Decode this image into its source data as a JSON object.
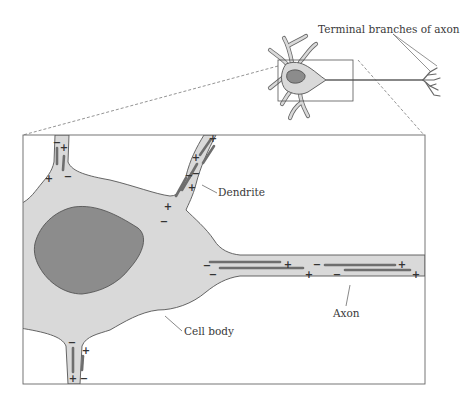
{
  "figure": {
    "labels": {
      "terminal_branches": "Terminal branches of axon",
      "dendrite": "Dendrite",
      "axon": "Axon",
      "cell_body": "Cell body"
    },
    "signs": {
      "plus": "+",
      "minus": "−"
    },
    "colors": {
      "cytoplasm": "#d9d9d9",
      "nucleus": "#8c8c8c",
      "outline": "#555555",
      "charge_bar": "#6e6e6e",
      "background": "#ffffff"
    }
  }
}
